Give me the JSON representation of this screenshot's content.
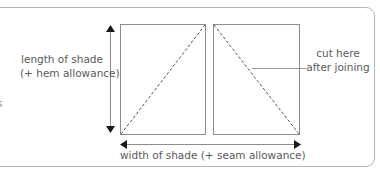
{
  "diagram": {
    "labels": {
      "length_line1": "length of shade",
      "length_line2": "(+ hem allowance)",
      "cut_line1": "cut here",
      "cut_line2": "after joining",
      "width": "width of shade (+ seam allowance)",
      "clipped_left": "s"
    },
    "colors": {
      "line": "#8c8c8c",
      "arrow": "#1a1a1a",
      "border": "#b5b5b5",
      "text": "#5a5a5a"
    },
    "panels": [
      {
        "name": "left-panel",
        "diagonal": "bottom-left-to-top-right"
      },
      {
        "name": "right-panel",
        "diagonal": "top-left-to-bottom-right"
      }
    ]
  }
}
